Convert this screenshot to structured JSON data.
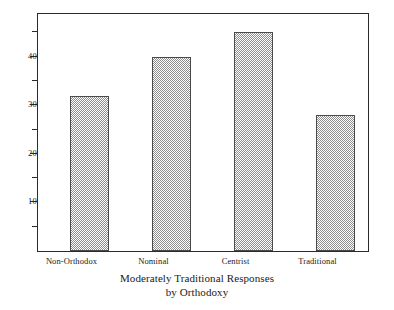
{
  "chart_data": {
    "type": "bar",
    "title": "",
    "caption_line1": "Moderately Traditional Responses",
    "caption_line2": "by Orthodoxy",
    "xlabel": "",
    "ylabel": "",
    "categories": [
      "Non-Orthodox",
      "Nominal",
      "Centrist",
      "Traditional"
    ],
    "values": [
      32,
      40,
      45,
      28
    ],
    "ylim": [
      0,
      48.8
    ],
    "y_tick_labels": [
      "10",
      "20",
      "30",
      "40"
    ],
    "y_major_ticks": [
      10,
      20,
      30,
      40
    ],
    "y_minor_ticks": [
      5,
      15,
      25,
      35,
      45
    ],
    "grid": false,
    "legend": "none",
    "bar_fill": "#8d8d8d",
    "bar_edge_color": "#4a4a4a",
    "frame_color": "#2b2b2b",
    "background": "#ffffff"
  },
  "axis": {
    "y_labels": [
      {
        "text": "40",
        "value": 40
      },
      {
        "text": "30",
        "value": 30
      },
      {
        "text": "20",
        "value": 20
      },
      {
        "text": "10",
        "value": 10
      }
    ]
  },
  "bars": [
    {
      "label": "Non-Orthodox",
      "value": 32
    },
    {
      "label": "Nominal",
      "value": 40
    },
    {
      "label": "Centrist",
      "value": 45
    },
    {
      "label": "Traditional",
      "value": 28
    }
  ]
}
